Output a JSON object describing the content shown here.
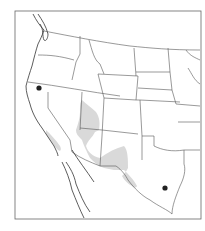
{
  "map": {
    "type": "species-range-map",
    "region": "Western United States and northern Mexico",
    "colors": {
      "background": "#ffffff",
      "borders": "#555555",
      "range_shading": "#d9d9d9",
      "point_marker": "#222222"
    },
    "legend": [],
    "range_areas": [
      {
        "name": "range-utah-arizona-newmexico",
        "description": "Shaded distribution across southern Utah, Arizona, New Mexico and west Texas"
      },
      {
        "name": "range-california-central",
        "description": "Faint shaded area in central/southern California"
      }
    ],
    "point_locations": [
      {
        "name": "northern-california-record",
        "x": 39,
        "y": 88
      },
      {
        "name": "texas-record",
        "x": 165,
        "y": 188
      }
    ]
  }
}
